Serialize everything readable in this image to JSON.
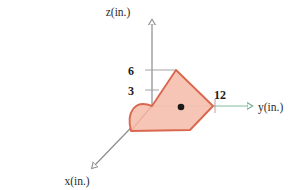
{
  "figure": {
    "background": "#ffffff",
    "axes": [
      {
        "id": "z",
        "label": "z(in.)",
        "label_x": 118,
        "label_y": 14,
        "color": "#8c8c8c",
        "arrow": true
      },
      {
        "id": "y",
        "label": "y(in.)",
        "label_x": 258,
        "label_y": 110,
        "color": "#7fbf9a",
        "arrow": true
      },
      {
        "id": "x",
        "label": "x(in.)",
        "label_x": 77,
        "label_y": 183,
        "color": "#8c8c8c",
        "arrow": true
      }
    ],
    "ticks": [
      {
        "axis": "z",
        "value": "6",
        "label_x": 131,
        "label_y": 75,
        "tick_y": 70
      },
      {
        "axis": "z",
        "value": "3",
        "label_x": 131,
        "label_y": 95,
        "tick_y": 90
      },
      {
        "axis": "y",
        "value": "12",
        "label_x": 214,
        "label_y": 99,
        "tick_x": 215
      }
    ],
    "shape": {
      "name": "shaded-area",
      "fill": "#f6c2b2",
      "stroke": "#d9684f",
      "stroke_width": 1.8,
      "vertices": [
        {
          "x": 176,
          "y": 70
        },
        {
          "x": 213,
          "y": 106
        },
        {
          "x": 190,
          "y": 130
        },
        {
          "x": 131,
          "y": 131
        },
        {
          "x": 152,
          "y": 106
        }
      ],
      "arc": {
        "from_x": 131,
        "from_y": 131,
        "to_x": 152,
        "to_y": 106,
        "bulge": "upper-left"
      }
    },
    "centroid_marker": {
      "name": "centroid-dot",
      "x": 181,
      "y": 107,
      "r": 3.2,
      "color": "#1a1a1a"
    },
    "origin": {
      "x": 152,
      "y": 106
    }
  }
}
